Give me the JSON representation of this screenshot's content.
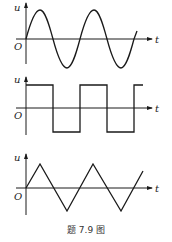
{
  "figure": {
    "caption": "题 7.9 图",
    "panels": [
      {
        "name": "sine",
        "y_label": "u",
        "x_label": "t",
        "origin_label": "O",
        "waveform": "sine"
      },
      {
        "name": "square",
        "y_label": "u",
        "x_label": "t",
        "origin_label": "O",
        "waveform": "square"
      },
      {
        "name": "triangle",
        "y_label": "u",
        "x_label": "t",
        "origin_label": "O",
        "waveform": "triangle"
      }
    ]
  },
  "colors": {
    "line": "#1a1a1a",
    "background": "#ffffff"
  }
}
